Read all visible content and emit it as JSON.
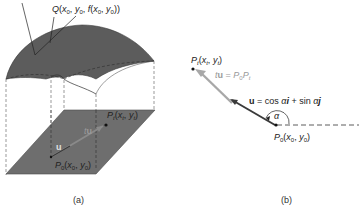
{
  "figure_a": {
    "caption": "(a)",
    "label_Q": "Q(x₀, y₀, f(x₀, y₀))",
    "label_P0": "P₀(x₀, y₀)",
    "label_Pt": "Pₜ(xₜ, yₜ)",
    "label_u": "u",
    "label_tu": "tu"
  },
  "figure_b": {
    "caption": "(b)",
    "label_Pt": "Pₜ(xₜ, yₜ)",
    "label_tu": "tu = P₀Pₜ",
    "label_u": "u = cos α i + sin α j",
    "label_alpha": "α",
    "label_P0": "P₀(x₀, y₀)"
  },
  "colors": {
    "surface": "#5a5a5a",
    "plane": "#6e6e6e",
    "vector_dark": "#3a3a3a",
    "vector_light": "#a8a8a8",
    "text": "#222222"
  }
}
